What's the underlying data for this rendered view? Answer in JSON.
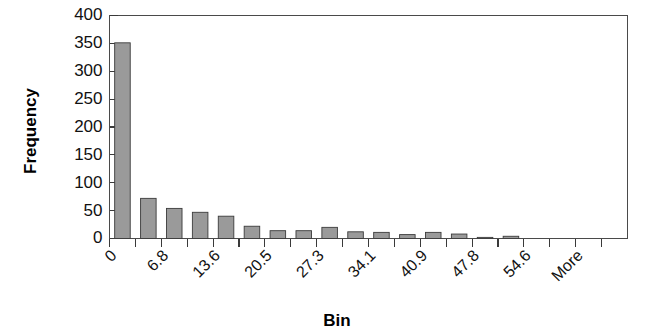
{
  "chart_data": {
    "type": "bar",
    "title": "",
    "subtitle": "",
    "xlabel": "Bin",
    "ylabel": "Frequency",
    "ylim": [
      0,
      400
    ],
    "ytick_values": [
      0,
      50,
      100,
      150,
      200,
      250,
      300,
      350,
      400
    ],
    "ytick_labels": [
      "0",
      "50",
      "100",
      "150",
      "200",
      "250",
      "300",
      "350",
      "400"
    ],
    "grid": false,
    "legend": null,
    "legend_position": "none",
    "bar_color": "#9a9a9a",
    "bar_edge_color": "#3b3b3b",
    "axis_color": "#3a3a3a",
    "xtick_rotation": 45,
    "xtick_labels_shown": [
      "0",
      "6.8",
      "13.6",
      "20.5",
      "27.3",
      "34.1",
      "40.9",
      "47.8",
      "54.6",
      "More"
    ],
    "categories": [
      "0",
      "3.4",
      "6.8",
      "10.2",
      "13.6",
      "17.1",
      "20.5",
      "23.9",
      "27.3",
      "30.7",
      "34.1",
      "37.5",
      "40.9",
      "44.3",
      "47.8",
      "51.2",
      "54.6",
      "58.0",
      "61.4",
      "More"
    ],
    "values": [
      351,
      72,
      54,
      47,
      40,
      22,
      14,
      14,
      20,
      12,
      11,
      7,
      11,
      8,
      2,
      4,
      0,
      0,
      0,
      0
    ],
    "n_bars": 20
  },
  "axis_titles": {
    "y": "Frequency",
    "x": "Bin"
  }
}
